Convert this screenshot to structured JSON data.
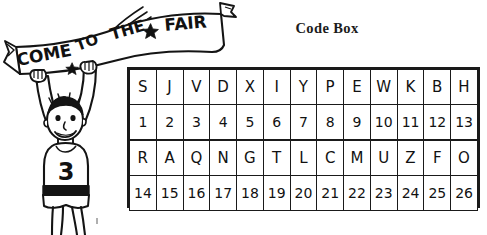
{
  "page": {
    "background_color": "#ffffff",
    "ink_color": "#111111"
  },
  "illustration": {
    "name": "boy-holding-fair-banner",
    "description": "Hand-drawn cartoon of a smiling boy with arms raised holding a long curved banner overhead",
    "banner": {
      "words": [
        "COME",
        "TO",
        "THE",
        "FAIR"
      ],
      "full_text": "COME TO THE FAIR",
      "star_glyph": "✦",
      "has_motion_lines": true,
      "has_flag_tail": true
    },
    "figure": {
      "shirt_number": "3",
      "has_shorts": true,
      "expression": "smiling"
    }
  },
  "codebox": {
    "title": "Code Box",
    "rows": [
      {
        "letters": [
          "S",
          "J",
          "V",
          "D",
          "X",
          "I",
          "Y",
          "P",
          "E",
          "W",
          "K",
          "B",
          "H"
        ],
        "numbers": [
          "1",
          "2",
          "3",
          "4",
          "5",
          "6",
          "7",
          "8",
          "9",
          "10",
          "11",
          "12",
          "13"
        ]
      },
      {
        "letters": [
          "R",
          "A",
          "Q",
          "N",
          "G",
          "T",
          "L",
          "C",
          "M",
          "U",
          "Z",
          "F",
          "O"
        ],
        "numbers": [
          "14",
          "15",
          "16",
          "17",
          "18",
          "19",
          "20",
          "21",
          "22",
          "23",
          "24",
          "25",
          "26"
        ]
      }
    ]
  }
}
